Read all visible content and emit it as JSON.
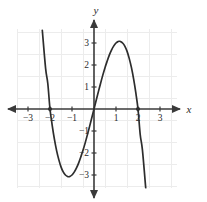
{
  "figure": {
    "title": "",
    "background_color": "#ffffff",
    "width": 207,
    "height": 202
  },
  "axes": {
    "x_axis_label": "x",
    "y_axis_label": "y",
    "axis_color": "#3a3a3a",
    "grid_color": "#ececec",
    "origin_px": {
      "x": 94,
      "y": 109
    },
    "unit_px": 22,
    "x_ticks": [
      -3,
      -2,
      -1,
      1,
      2,
      3
    ],
    "y_ticks": [
      3,
      2,
      1,
      -1,
      -2,
      -3
    ],
    "x_tick_labels": [
      "−3",
      "−2",
      "−1",
      "1",
      "2",
      "3"
    ],
    "y_tick_labels": [
      "3",
      "2",
      "1",
      "−1",
      "−2",
      "−3"
    ],
    "xlim": [
      -3.5,
      3.75
    ],
    "ylim": [
      -3.7,
      3.7
    ],
    "grid": true,
    "arrows": [
      "left",
      "right",
      "up",
      "down"
    ]
  },
  "chart_data": {
    "type": "line",
    "title": "",
    "xlabel": "x",
    "ylabel": "y",
    "xlim": [
      -3.5,
      3.75
    ],
    "ylim": [
      -3.7,
      3.7
    ],
    "grid": true,
    "legend": null,
    "curve_color": "#2d2d2d",
    "curve_width_px": 1.7,
    "function": "y = 4x - x^3",
    "series": [
      {
        "name": "y = 4x - x³",
        "x": [
          -2.35,
          -2.2,
          -2.1,
          -2.0,
          -1.9,
          -1.8,
          -1.7,
          -1.6,
          -1.5,
          -1.4,
          -1.3,
          -1.2,
          -1.15,
          -1.1,
          -1.0,
          -0.9,
          -0.8,
          -0.7,
          -0.6,
          -0.5,
          -0.4,
          -0.3,
          -0.2,
          -0.1,
          0.0,
          0.1,
          0.2,
          0.3,
          0.4,
          0.5,
          0.6,
          0.7,
          0.8,
          0.9,
          1.0,
          1.1,
          1.15,
          1.2,
          1.3,
          1.4,
          1.5,
          1.6,
          1.7,
          1.8,
          1.9,
          2.0,
          2.1,
          2.2,
          2.35
        ],
        "y": [
          3.58,
          1.85,
          1.16,
          0.0,
          -0.74,
          -1.37,
          -1.89,
          -2.3,
          -2.63,
          -2.86,
          -3.0,
          -3.07,
          -3.08,
          -3.07,
          -3.0,
          -2.87,
          -2.69,
          -2.46,
          -2.18,
          -1.88,
          -1.54,
          -1.17,
          -0.79,
          -0.4,
          0.0,
          0.4,
          0.79,
          1.17,
          1.54,
          1.88,
          2.18,
          2.46,
          2.69,
          2.87,
          3.0,
          3.07,
          3.08,
          3.07,
          3.0,
          2.86,
          2.63,
          2.3,
          1.89,
          1.37,
          0.74,
          0.0,
          -1.16,
          -1.85,
          -3.58
        ]
      }
    ],
    "markers": [
      {
        "name": "left-root-point",
        "x": -2,
        "y": 0,
        "style": "filled-circle",
        "color": "#2d2d2d"
      },
      {
        "name": "right-root-point",
        "x": 2,
        "y": 0,
        "style": "filled-circle",
        "color": "#2d2d2d"
      }
    ],
    "key_features": {
      "roots": [
        -2,
        0,
        2
      ],
      "local_maximum": {
        "x": 1,
        "y": 3
      },
      "local_minimum": {
        "x": -1,
        "y": -3
      }
    }
  }
}
